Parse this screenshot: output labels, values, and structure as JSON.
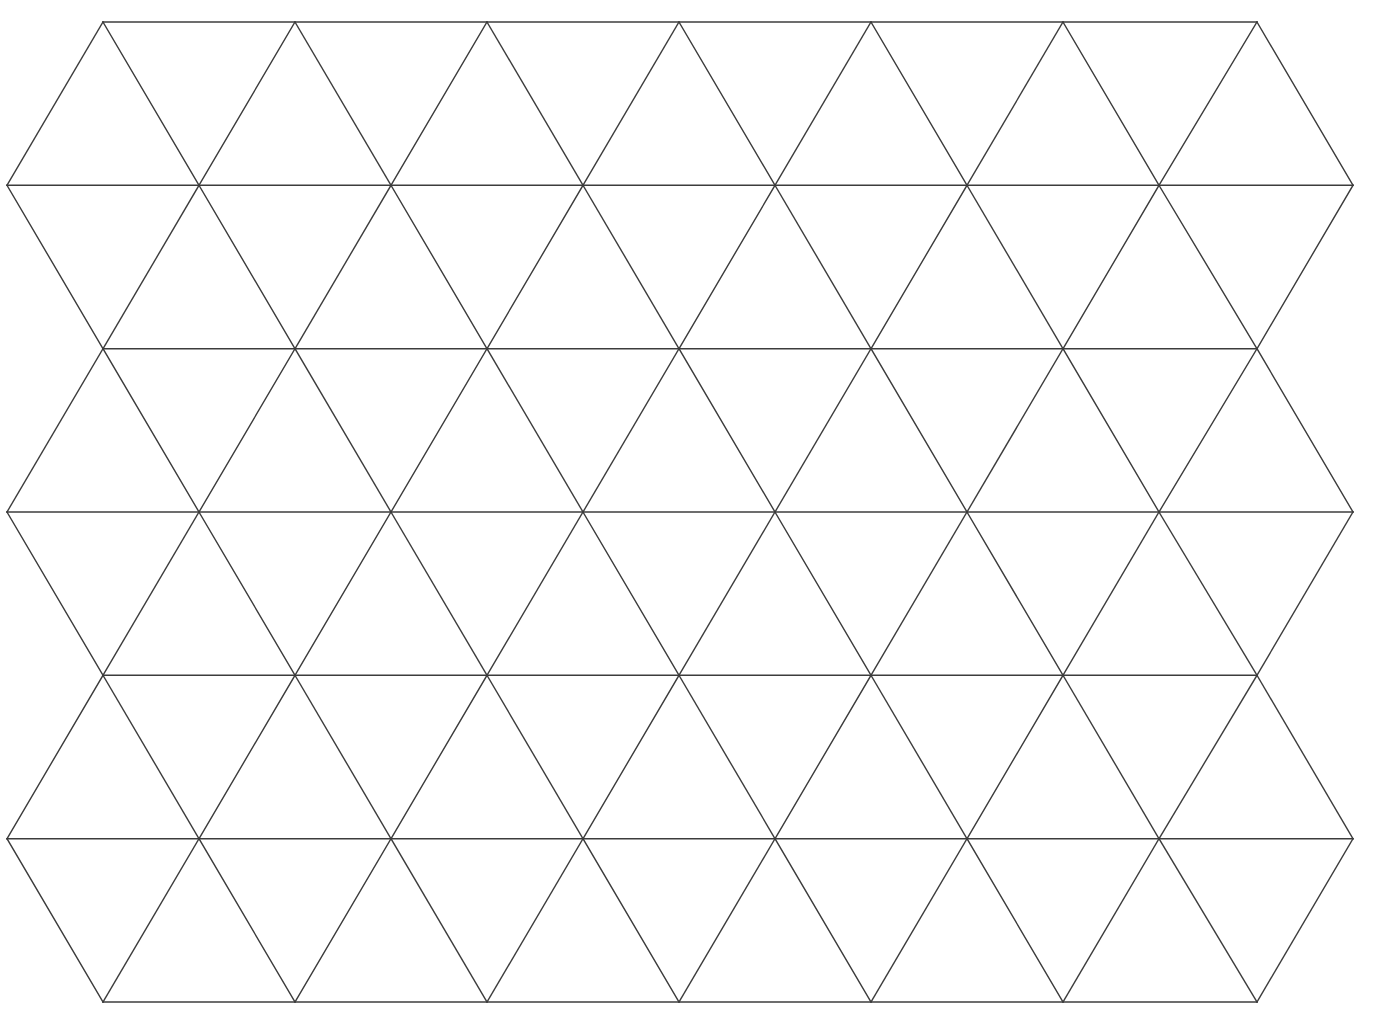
{
  "figure": {
    "title": "",
    "caption_clipped": "p g p y p",
    "background_color": "#ffffff",
    "line_color": "#3c3c3c",
    "line_width": 1.4,
    "width": 1376,
    "height": 1034
  },
  "chart_data": {
    "type": "diagram",
    "subtype": "triangular-lattice",
    "xlabel": "",
    "ylabel": "",
    "grid": true,
    "legend": "none",
    "xlim": [
      7,
      1353
    ],
    "ylim": [
      22,
      1002
    ],
    "geometry": {
      "rows": 7,
      "row_y": [
        22,
        185.3,
        348.7,
        512,
        675.3,
        838.7,
        1002
      ],
      "row_spacing": 163.33,
      "column_spacing": 192,
      "short_row_x_start": 103,
      "short_row_x_end": 1257,
      "short_row_vertex_count": 7,
      "long_row_x_start": 7,
      "long_row_x_end": 1353,
      "long_row_vertex_count": 8,
      "triangle_side": 192,
      "triangle_height": 163.33,
      "up_triangles": 42,
      "down_triangles": 42,
      "total_triangles": 84
    },
    "short_row_vertices_x": [
      103,
      295,
      487,
      679,
      871,
      1063,
      1257
    ],
    "long_row_vertices_x": [
      7,
      199,
      391,
      583,
      775,
      967,
      1159,
      1353
    ],
    "horizontal_lines": [
      {
        "index": 1,
        "y": 22,
        "x1": 103,
        "x2": 1257,
        "type": "short"
      },
      {
        "index": 2,
        "y": 185.3,
        "x1": 7,
        "x2": 1353,
        "type": "long"
      },
      {
        "index": 3,
        "y": 348.7,
        "x1": 103,
        "x2": 1257,
        "type": "short"
      },
      {
        "index": 4,
        "y": 512,
        "x1": 7,
        "x2": 1353,
        "type": "long"
      },
      {
        "index": 5,
        "y": 675.3,
        "x1": 103,
        "x2": 1257,
        "type": "short"
      },
      {
        "index": 6,
        "y": 838.7,
        "x1": 7,
        "x2": 1353,
        "type": "long"
      },
      {
        "index": 7,
        "y": 1002,
        "x1": 103,
        "x2": 1257,
        "type": "short"
      }
    ],
    "band_count": 6
  }
}
